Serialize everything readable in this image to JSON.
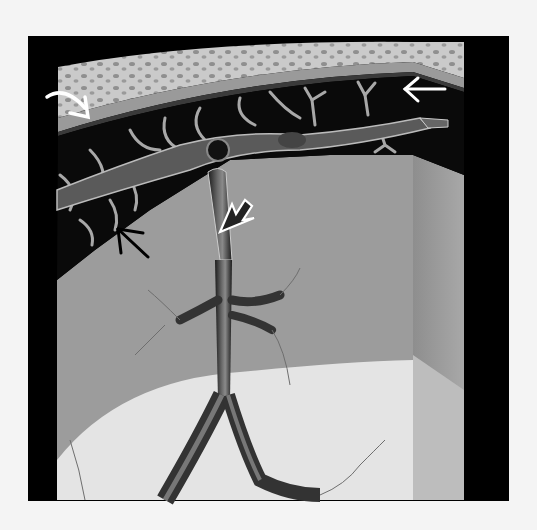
{
  "figure": {
    "colors": {
      "page_background": "#f4f4f4",
      "frame": "#000000",
      "bone": "#c8c8c8",
      "bone_spots": "#8a8a8a",
      "dura": "#9a9a9a",
      "subarachnoid_space": "#0a0a0a",
      "trabeculae": "#a8a8a8",
      "brain_surface": "#9c9c9c",
      "brain_lower_light": "#e4e4e4",
      "side_panel": "#a0a0a0",
      "vessel": "#3a3a3a"
    },
    "annotations": [
      {
        "id": "curved-white-arrow",
        "style": "white curved arrow",
        "points_to": "dura layer, upper left"
      },
      {
        "id": "white-arrow-left",
        "style": "white straight arrow pointing left",
        "points_to": "arachnoid trabeculae, upper right"
      },
      {
        "id": "open-white-arrow",
        "style": "white outlined arrow pointing up-left",
        "points_to": "bridging vein"
      },
      {
        "id": "black-arrow",
        "style": "black straight arrow pointing up-left",
        "points_to": "pia/arachnoid membrane edge"
      }
    ]
  }
}
